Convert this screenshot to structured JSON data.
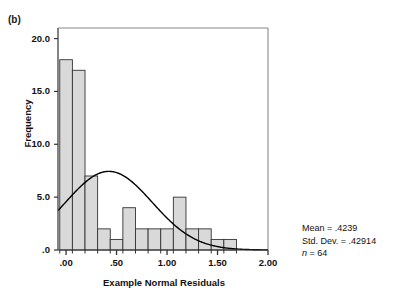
{
  "panel": {
    "label": "(b)"
  },
  "chart_data": {
    "type": "bar",
    "title": "",
    "subtitle": "",
    "xlabel": "Example Normal Residuals",
    "ylabel": "Frequency",
    "xlim": [
      -0.08,
      2.0
    ],
    "ylim": [
      0,
      21
    ],
    "grid": false,
    "legend_position": "none",
    "xticks": [
      ".00",
      ".50",
      "1.00",
      "1.50",
      "2.00"
    ],
    "xtick_values": [
      0.0,
      0.5,
      1.0,
      1.5,
      2.0
    ],
    "yticks": [
      ".0",
      "5.0",
      "10.0",
      "15.0",
      "20.0"
    ],
    "ytick_values": [
      0,
      5,
      10,
      15,
      20
    ],
    "bin_width": 0.125,
    "bin_starts": [
      -0.0625,
      0.0625,
      0.1875,
      0.3125,
      0.4375,
      0.5625,
      0.6875,
      0.8125,
      0.9375,
      1.0625,
      1.1875,
      1.3125,
      1.4375,
      1.5625
    ],
    "categories": [
      "0.00",
      "0.13",
      "0.25",
      "0.38",
      "0.50",
      "0.63",
      "0.75",
      "0.88",
      "1.00",
      "1.13",
      "1.25",
      "1.38",
      "1.50",
      "1.63"
    ],
    "values": [
      18,
      17,
      7,
      2,
      1,
      4,
      2,
      2,
      2,
      5,
      2,
      2,
      1,
      1
    ],
    "series": [
      {
        "name": "Frequency",
        "values": [
          18,
          17,
          7,
          2,
          1,
          4,
          2,
          2,
          2,
          5,
          2,
          2,
          1,
          1
        ]
      }
    ],
    "overlay": {
      "type": "line",
      "name": "Normal curve",
      "mean": 0.4239,
      "std_dev": 0.42914,
      "n": 64,
      "peak_value": 7.3,
      "bin_width": 0.125
    },
    "bar_fill_color": "#d9d9d9",
    "bar_edge_color": "#333333",
    "curve_color": "#000000",
    "axis_color": "#555555"
  },
  "stats": {
    "mean": "Mean = .4239",
    "std_dev": "Std. Dev. = .42914",
    "n_prefix": "n",
    "n_value": " = 64"
  }
}
